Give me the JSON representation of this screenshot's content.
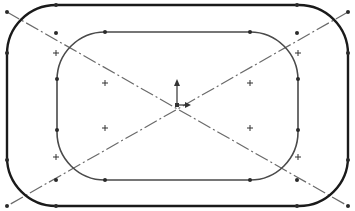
{
  "sketch": {
    "colors": {
      "background": "#ffffff",
      "outer_line": "#1a1a1a",
      "inner_line": "#4a4a4a",
      "centerline": "#6a6a6a",
      "point": "#2a2a2a",
      "plus": "#333333",
      "origin": "#333333"
    },
    "outer_rect": {
      "x": 7,
      "y": 5,
      "w": 341,
      "h": 201,
      "r": 49,
      "stroke_width": 2.4
    },
    "inner_rect": {
      "x": 57,
      "y": 32,
      "w": 241,
      "h": 148,
      "r": 48,
      "stroke_width": 1.6
    },
    "centerlines": [
      {
        "x1": 7,
        "y1": 12,
        "x2": 348,
        "y2": 206
      },
      {
        "x1": 348,
        "y1": 12,
        "x2": 7,
        "y2": 206
      }
    ],
    "points": [
      [
        56,
        5
      ],
      [
        297,
        5
      ],
      [
        7,
        53
      ],
      [
        348,
        53
      ],
      [
        7,
        160
      ],
      [
        348,
        160
      ],
      [
        56,
        206
      ],
      [
        297,
        206
      ],
      [
        105,
        32
      ],
      [
        250,
        32
      ],
      [
        57,
        79
      ],
      [
        57,
        130
      ],
      [
        298,
        79
      ],
      [
        298,
        130
      ],
      [
        105,
        180
      ],
      [
        250,
        180
      ],
      [
        7,
        12
      ],
      [
        348,
        12
      ],
      [
        7,
        206
      ],
      [
        348,
        206
      ],
      [
        56,
        33
      ],
      [
        297,
        33
      ],
      [
        56,
        180
      ],
      [
        297,
        180
      ]
    ],
    "plus_marks": [
      [
        56,
        53
      ],
      [
        298,
        53
      ],
      [
        56,
        157
      ],
      [
        298,
        157
      ],
      [
        105,
        83
      ],
      [
        250,
        83
      ],
      [
        105,
        128
      ],
      [
        250,
        128
      ]
    ],
    "origin": {
      "x": 177,
      "y": 105,
      "arrow_up_len": 26,
      "arrow_right_len": 14
    }
  }
}
